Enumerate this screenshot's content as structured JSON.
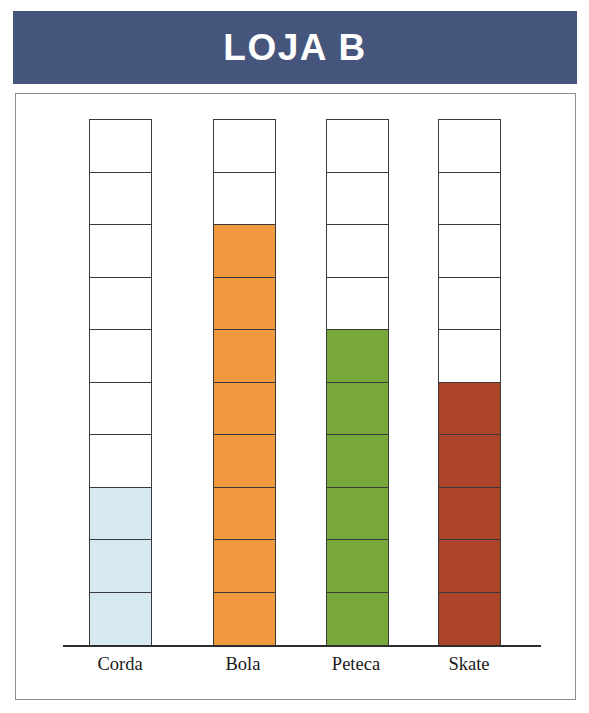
{
  "header": {
    "title": "LOJA B",
    "background_color": "#46557c",
    "text_color": "#ffffff"
  },
  "chart_data": {
    "type": "bar",
    "title": "LOJA B",
    "xlabel": "",
    "ylabel": "",
    "ylim": [
      0,
      10
    ],
    "grid": false,
    "legend": "none",
    "unit_note": "pictograph-style stacked unit squares; each column has 10 unit cells",
    "cells_per_column": 10,
    "categories": [
      "Corda",
      "Bola",
      "Peteca",
      "Skate"
    ],
    "values": [
      3,
      8,
      6,
      5
    ],
    "colors": [
      "#d6e9f0",
      "#f0993f",
      "#79a83a",
      "#ab4429"
    ],
    "series": [
      {
        "name": "Quantidade",
        "values": [
          3,
          8,
          6,
          5
        ]
      }
    ],
    "bars": [
      {
        "category": "Corda",
        "value": 3,
        "filled": 3,
        "empty": 7,
        "color": "#d6e9f0",
        "outline": "#3a3a3a"
      },
      {
        "category": "Bola",
        "value": 8,
        "filled": 8,
        "empty": 2,
        "color": "#f0993f",
        "outline": "#3a3a3a"
      },
      {
        "category": "Peteca",
        "value": 6,
        "filled": 6,
        "empty": 4,
        "color": "#79a83a",
        "outline": "#3a3a3a"
      },
      {
        "category": "Skate",
        "value": 5,
        "filled": 5,
        "empty": 5,
        "color": "#ab4429",
        "outline": "#3a3a3a"
      }
    ]
  },
  "frame": {
    "border_color": "#8e8e8e",
    "axis_color": "#2e2e2e"
  }
}
